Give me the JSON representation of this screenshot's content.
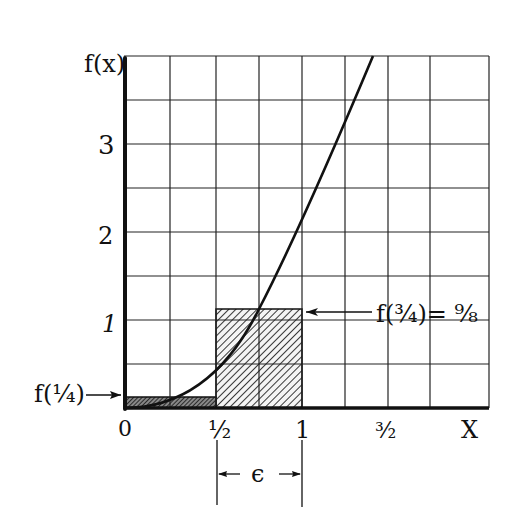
{
  "diagram": {
    "y_axis_label": "f(x)",
    "x_axis_label": "X",
    "y_ticks": [
      {
        "value": 1,
        "label": "1"
      },
      {
        "value": 2,
        "label": "2"
      },
      {
        "value": 3,
        "label": "3"
      }
    ],
    "x_ticks": [
      {
        "value": 0,
        "label": "0"
      },
      {
        "value": 0.5,
        "label": "½"
      },
      {
        "value": 1,
        "label": "1"
      },
      {
        "value": 1.5,
        "label": "³⁄₂"
      }
    ],
    "grid": {
      "x_min": 0,
      "x_max": 2.0,
      "x_step": 0.25,
      "y_min": 0,
      "y_max": 4,
      "y_step": 0.5
    },
    "curve": {
      "function": "f(x) = 2x^2"
    },
    "rectangles": [
      {
        "name": "lower-rect",
        "x0": 0,
        "x1": 0.5,
        "height": 0.125,
        "label": "f(¼)"
      },
      {
        "name": "upper-rect",
        "x0": 0.5,
        "x1": 1,
        "height": 1.125,
        "label": "f(¾)= ⁹⁄₈"
      }
    ],
    "epsilon_label": "ϵ",
    "annotations": {
      "f_quarter": "f(¼)",
      "f_three_quarters": "f(¾)= ⁹⁄₈"
    }
  }
}
